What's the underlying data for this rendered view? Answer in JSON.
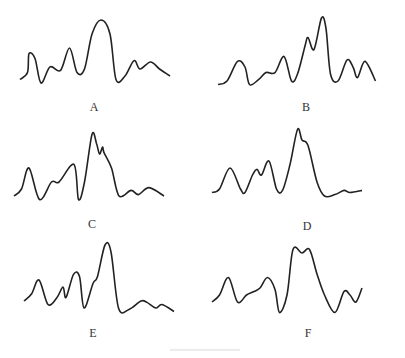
{
  "figure": {
    "panels": [
      {
        "label": "A",
        "points": [
          [
            0,
            0.15
          ],
          [
            0.05,
            0.25
          ],
          [
            0.06,
            0.52
          ],
          [
            0.1,
            0.45
          ],
          [
            0.14,
            0.1
          ],
          [
            0.2,
            0.33
          ],
          [
            0.27,
            0.28
          ],
          [
            0.33,
            0.6
          ],
          [
            0.38,
            0.25
          ],
          [
            0.43,
            0.3
          ],
          [
            0.48,
            0.8
          ],
          [
            0.54,
            1.0
          ],
          [
            0.6,
            0.8
          ],
          [
            0.64,
            0.15
          ],
          [
            0.7,
            0.2
          ],
          [
            0.76,
            0.42
          ],
          [
            0.8,
            0.3
          ],
          [
            0.87,
            0.4
          ],
          [
            0.93,
            0.3
          ],
          [
            1.0,
            0.2
          ]
        ]
      },
      {
        "label": "B",
        "points": [
          [
            0,
            0.05
          ],
          [
            0.06,
            0.1
          ],
          [
            0.13,
            0.38
          ],
          [
            0.18,
            0.3
          ],
          [
            0.21,
            0.05
          ],
          [
            0.27,
            0.12
          ],
          [
            0.32,
            0.22
          ],
          [
            0.38,
            0.22
          ],
          [
            0.44,
            0.45
          ],
          [
            0.49,
            0.1
          ],
          [
            0.53,
            0.2
          ],
          [
            0.58,
            0.6
          ],
          [
            0.6,
            0.72
          ],
          [
            0.64,
            0.55
          ],
          [
            0.69,
            1.0
          ],
          [
            0.72,
            0.85
          ],
          [
            0.75,
            0.2
          ],
          [
            0.8,
            0.1
          ],
          [
            0.86,
            0.4
          ],
          [
            0.9,
            0.3
          ],
          [
            0.93,
            0.15
          ],
          [
            0.98,
            0.38
          ],
          [
            1.05,
            0.1
          ]
        ]
      },
      {
        "label": "C",
        "points": [
          [
            0,
            0.1
          ],
          [
            0.05,
            0.2
          ],
          [
            0.1,
            0.5
          ],
          [
            0.17,
            0.05
          ],
          [
            0.25,
            0.3
          ],
          [
            0.3,
            0.3
          ],
          [
            0.4,
            0.55
          ],
          [
            0.43,
            0.05
          ],
          [
            0.47,
            0.3
          ],
          [
            0.52,
            0.98
          ],
          [
            0.55,
            0.85
          ],
          [
            0.57,
            0.7
          ],
          [
            0.59,
            0.8
          ],
          [
            0.6,
            0.72
          ],
          [
            0.65,
            0.5
          ],
          [
            0.7,
            0.1
          ],
          [
            0.78,
            0.18
          ],
          [
            0.83,
            0.12
          ],
          [
            0.9,
            0.22
          ],
          [
            1.0,
            0.1
          ]
        ]
      },
      {
        "label": "D",
        "points": [
          [
            0,
            0.05
          ],
          [
            0.05,
            0.1
          ],
          [
            0.12,
            0.4
          ],
          [
            0.19,
            0.1
          ],
          [
            0.22,
            0.05
          ],
          [
            0.27,
            0.3
          ],
          [
            0.3,
            0.38
          ],
          [
            0.33,
            0.3
          ],
          [
            0.38,
            0.5
          ],
          [
            0.43,
            0.1
          ],
          [
            0.47,
            0.08
          ],
          [
            0.52,
            0.45
          ],
          [
            0.57,
            0.95
          ],
          [
            0.6,
            0.8
          ],
          [
            0.64,
            0.72
          ],
          [
            0.7,
            0.2
          ],
          [
            0.75,
            0.0
          ],
          [
            0.82,
            0.02
          ],
          [
            0.88,
            0.08
          ],
          [
            0.92,
            0.05
          ],
          [
            1.0,
            0.08
          ]
        ]
      },
      {
        "label": "E",
        "points": [
          [
            0,
            0.2
          ],
          [
            0.05,
            0.3
          ],
          [
            0.1,
            0.5
          ],
          [
            0.16,
            0.15
          ],
          [
            0.22,
            0.25
          ],
          [
            0.26,
            0.4
          ],
          [
            0.28,
            0.25
          ],
          [
            0.33,
            0.58
          ],
          [
            0.37,
            0.55
          ],
          [
            0.4,
            0.1
          ],
          [
            0.46,
            0.45
          ],
          [
            0.49,
            0.55
          ],
          [
            0.54,
            1.0
          ],
          [
            0.58,
            0.9
          ],
          [
            0.63,
            0.1
          ],
          [
            0.7,
            0.08
          ],
          [
            0.78,
            0.2
          ],
          [
            0.82,
            0.18
          ],
          [
            0.88,
            0.1
          ],
          [
            0.92,
            0.15
          ],
          [
            1.0,
            0.05
          ]
        ]
      },
      {
        "label": "F",
        "points": [
          [
            0,
            0.2
          ],
          [
            0.05,
            0.3
          ],
          [
            0.11,
            0.55
          ],
          [
            0.17,
            0.2
          ],
          [
            0.23,
            0.3
          ],
          [
            0.28,
            0.35
          ],
          [
            0.32,
            0.4
          ],
          [
            0.37,
            0.55
          ],
          [
            0.42,
            0.38
          ],
          [
            0.45,
            0.05
          ],
          [
            0.5,
            0.3
          ],
          [
            0.54,
            0.95
          ],
          [
            0.6,
            0.9
          ],
          [
            0.65,
            0.95
          ],
          [
            0.7,
            0.6
          ],
          [
            0.75,
            0.3
          ],
          [
            0.82,
            0.05
          ],
          [
            0.88,
            0.35
          ],
          [
            0.92,
            0.3
          ],
          [
            0.96,
            0.2
          ],
          [
            1.0,
            0.4
          ]
        ]
      }
    ]
  }
}
